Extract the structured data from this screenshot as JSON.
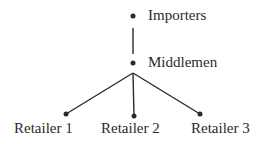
{
  "diagram": {
    "nodes": [
      {
        "id": "importers",
        "label": "Importers"
      },
      {
        "id": "middlemen",
        "label": "Middlemen"
      },
      {
        "id": "retailer1",
        "label": "Retailer 1"
      },
      {
        "id": "retailer2",
        "label": "Retailer 2"
      },
      {
        "id": "retailer3",
        "label": "Retailer 3"
      }
    ],
    "edges": [
      {
        "from": "importers",
        "to": "middlemen"
      },
      {
        "from": "middlemen",
        "to": "retailer1"
      },
      {
        "from": "middlemen",
        "to": "retailer2"
      },
      {
        "from": "middlemen",
        "to": "retailer3"
      }
    ],
    "colors": {
      "ink": "#2a2a2a",
      "background": "#ffffff"
    }
  }
}
